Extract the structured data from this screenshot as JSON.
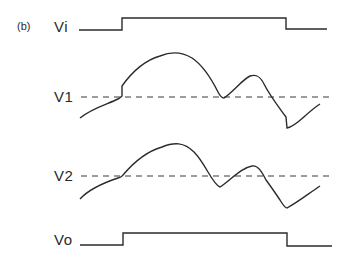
{
  "figure": {
    "panel_label": "(b)",
    "colors": {
      "line": "#2b2b2b",
      "dashed": "#3a3a3a",
      "background": "#ffffff"
    }
  },
  "signals": [
    {
      "id": "vi",
      "label": "Vi",
      "kind": "square-pulse",
      "points": "79,30 122,30 122,18 286,18 286,29 327,29"
    },
    {
      "id": "v1",
      "label": "V1",
      "kind": "analog-with-threshold",
      "threshold_y": 97,
      "threshold_x": [
        81,
        330
      ],
      "path": "M80,118 C92,108 108,104 118,99 C120,98 121,97 122,96 L122,86 C132,72 146,60 160,56 C172,51 182,52 192,58 C204,66 212,80 218,92 C220,96 222,98 224,98 C234,91 242,80 250,76 C256,74 260,76 264,84 C270,96 278,106 286,117 L287,128 C296,127 306,113 320,104"
    },
    {
      "id": "v2",
      "label": "V2",
      "kind": "analog-with-threshold",
      "threshold_y": 176,
      "threshold_x": [
        81,
        332
      ],
      "path": "M80,199 C90,188 106,182 118,178 C122,177 122,176 123,175 C134,162 148,151 162,147 C174,142 184,142 194,152 C206,164 212,184 220,187 C230,181 240,168 252,166 C258,165 262,172 266,180 C272,188 276,194 280,200 C283,205 285,208 287,208 C298,202 308,194 320,186"
    },
    {
      "id": "vo",
      "label": "Vo",
      "kind": "square-pulse",
      "points": "80,245 123,245 123,233 287,233 287,246 332,246"
    }
  ]
}
